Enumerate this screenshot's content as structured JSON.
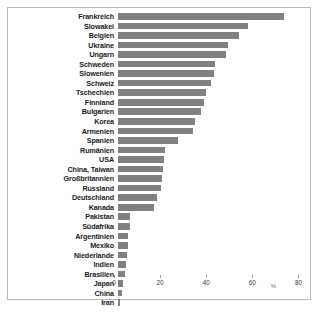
{
  "chart_data": {
    "type": "bar",
    "orientation": "horizontal",
    "title": "",
    "xlabel": "%",
    "ylabel": "",
    "xlim": [
      0,
      85
    ],
    "xticks": [
      0,
      20,
      40,
      60,
      80
    ],
    "grid": false,
    "bar_color": "#808080",
    "categories": [
      "Frankreich",
      "Slowakei",
      "Belgien",
      "Ukraine",
      "Ungarn",
      "Schweden",
      "Slowenien",
      "Schweiz",
      "Tschechien",
      "Finnland",
      "Bulgarien",
      "Korea",
      "Armenien",
      "Spanien",
      "Rumänien",
      "USA",
      "China, Taiwan",
      "Großbritannien",
      "Russland",
      "Deutschland",
      "Kanada",
      "Pakistan",
      "Südafrika",
      "Argentinien",
      "Mexiko",
      "Niederlande",
      "Indien",
      "Brasilien",
      "Japan",
      "China",
      "Iran"
    ],
    "values": [
      72.0,
      56.5,
      52.5,
      47.5,
      47.0,
      42.0,
      41.5,
      40.5,
      38.0,
      37.5,
      36.0,
      33.5,
      32.5,
      26.0,
      20.5,
      20.0,
      19.5,
      19.0,
      18.5,
      17.0,
      15.5,
      5.0,
      5.0,
      4.5,
      4.5,
      4.0,
      3.5,
      3.0,
      2.0,
      1.8,
      0.8
    ]
  },
  "axis": {
    "unit_mark": "%"
  }
}
